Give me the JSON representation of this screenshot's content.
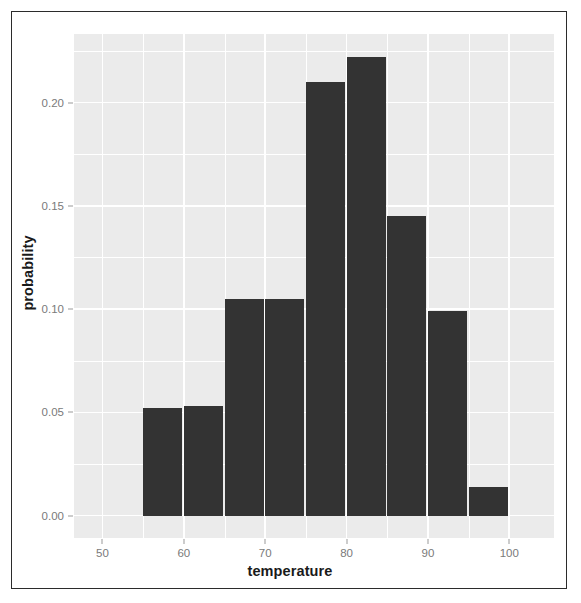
{
  "figure": {
    "background_color": "#ffffff",
    "frame_color": "#2b2b2b",
    "panel_color": "#ebebeb",
    "grid_color": "#ffffff",
    "bar_color": "#333333",
    "tick_label_color": "#7a7a7a",
    "axis_title_color": "#1a1a1a"
  },
  "axes": {
    "x_title": "temperature",
    "y_title": "probability",
    "x_ticks": [
      "50",
      "60",
      "70",
      "80",
      "90",
      "100"
    ],
    "x_tick_values": [
      50,
      60,
      70,
      80,
      90,
      100
    ],
    "y_ticks": [
      "0.00",
      "0.05",
      "0.10",
      "0.15",
      "0.20"
    ],
    "y_tick_values": [
      0.0,
      0.05,
      0.1,
      0.15,
      0.2
    ],
    "x_minor_values": [
      55,
      65,
      75,
      85,
      95
    ],
    "y_minor_values": [
      0.025,
      0.075,
      0.125,
      0.175,
      0.225
    ],
    "x_range": [
      46.5,
      105.5
    ],
    "y_range": [
      -0.0108,
      0.2332
    ]
  },
  "chart_data": {
    "type": "bar",
    "title": "",
    "subtitle": "",
    "xlabel": "temperature",
    "ylabel": "probability",
    "xlim": [
      46.5,
      105.5
    ],
    "ylim": [
      -0.0108,
      0.2332
    ],
    "grid": true,
    "legend": "none",
    "bin_width": 5,
    "bin_edges": [
      55,
      60,
      65,
      70,
      75,
      80,
      85,
      90,
      95,
      100
    ],
    "categories": [
      "55-60",
      "60-65",
      "65-70",
      "70-75",
      "75-80",
      "80-85",
      "85-90",
      "90-95",
      "95-100"
    ],
    "x": [
      57.5,
      62.5,
      67.5,
      72.5,
      77.5,
      82.5,
      87.5,
      92.5,
      97.5
    ],
    "values": [
      0.052,
      0.053,
      0.105,
      0.105,
      0.21,
      0.222,
      0.145,
      0.099,
      0.014
    ],
    "series": [
      {
        "name": "probability",
        "color": "#333333",
        "values": [
          0.052,
          0.053,
          0.105,
          0.105,
          0.21,
          0.222,
          0.145,
          0.099,
          0.014
        ]
      }
    ]
  }
}
